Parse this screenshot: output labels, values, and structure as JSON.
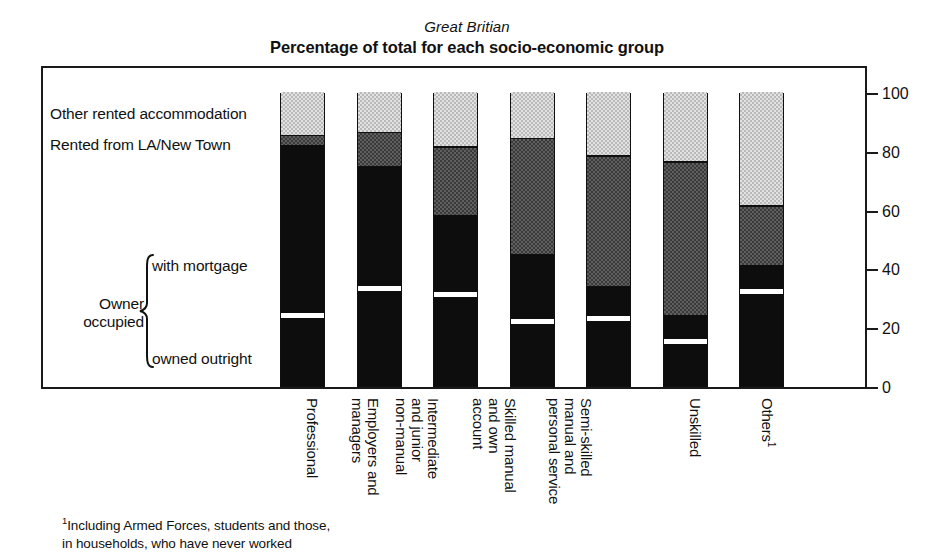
{
  "header": {
    "subtitle": "Great Britian",
    "title": "Percentage of total for each socio-economic group"
  },
  "legend": {
    "other_rented": "Other rented accommodation",
    "la_new_town": "Rented from LA/New Town",
    "with_mortgage": "with mortgage",
    "owner_occupied_line1": "Owner",
    "owner_occupied_line2": "occupied",
    "owned_outright": "owned outright"
  },
  "axis": {
    "ticks": [
      "100",
      "80",
      "60",
      "40",
      "20",
      "0"
    ]
  },
  "categories": [
    {
      "lines": [
        "Professional"
      ]
    },
    {
      "lines": [
        "Employers and",
        "managers"
      ]
    },
    {
      "lines": [
        "Intermediate",
        "and junior",
        "non-manual"
      ]
    },
    {
      "lines": [
        "Skilled manual",
        "and own",
        "account"
      ]
    },
    {
      "lines": [
        "Semi-skilled",
        "manual and",
        "personal service"
      ]
    },
    {
      "lines": [
        "Unskilled"
      ]
    },
    {
      "lines": [
        "Others"
      ],
      "superscript": "1"
    }
  ],
  "footnote": {
    "marker": "1",
    "line1": "Including Armed Forces, students and those,",
    "line2": "in households, who have never worked"
  },
  "colors": {
    "ink": "#111111",
    "owner_occupied": "#0d0d0d",
    "rented_la_new_town": "#5f5f5f",
    "other_rented": "#d0d0d0",
    "owner_split_rule": "#ffffff"
  },
  "chart_data": {
    "type": "bar",
    "subtype": "stacked-column",
    "title": "Percentage of total for each socio-economic group",
    "subtitle": "Great Britian",
    "xlabel": "",
    "ylabel": "",
    "ylim": [
      0,
      100
    ],
    "yticks": [
      0,
      20,
      40,
      60,
      80,
      100
    ],
    "grid": false,
    "legend_position": "left-inline",
    "categories": [
      "Professional",
      "Employers and managers",
      "Intermediate and junior non-manual",
      "Skilled manual and own account",
      "Semi-skilled manual and personal service",
      "Unskilled",
      "Others"
    ],
    "series": [
      {
        "name": "Owner occupied: owned outright",
        "values": [
          24,
          33,
          31,
          22,
          23,
          15,
          32
        ]
      },
      {
        "name": "Owner occupied: with mortgage",
        "values": [
          58,
          42,
          27,
          23,
          11,
          9,
          9
        ]
      },
      {
        "name": "Rented from LA/New Town",
        "values": [
          3,
          11,
          23,
          39,
          44,
          52,
          20
        ]
      },
      {
        "name": "Other rented accommodation",
        "values": [
          15,
          14,
          19,
          16,
          22,
          24,
          39
        ]
      }
    ],
    "stack_boundaries": {
      "note": "cumulative % from bottom of each column",
      "values": [
        [
          24,
          82,
          85,
          100
        ],
        [
          33,
          75,
          86,
          100
        ],
        [
          31,
          58,
          81,
          100
        ],
        [
          22,
          45,
          84,
          100
        ],
        [
          23,
          34,
          78,
          100
        ],
        [
          15,
          24,
          76,
          100
        ],
        [
          32,
          41,
          61,
          100
        ]
      ]
    },
    "footnote": "1 Including Armed Forces, students and those, in households, who have never worked"
  }
}
